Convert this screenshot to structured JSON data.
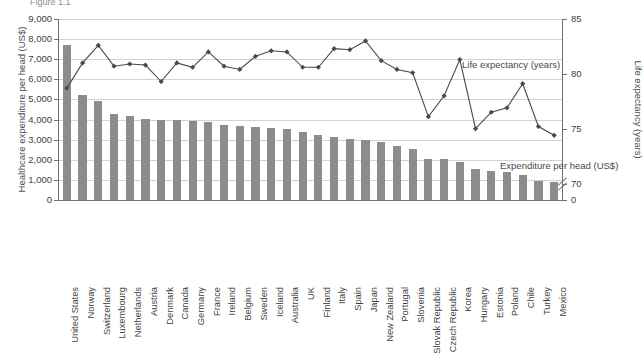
{
  "top_clipped_text": "Figure 1.1",
  "chart_data": {
    "type": "bar",
    "title": "",
    "xlabel": "",
    "ylabel": "Healthcare expenditure per head (US$)",
    "ylabel_right": "Life expectancy (years)",
    "ylim": [
      0,
      9000
    ],
    "ylim_right": [
      68.5,
      85
    ],
    "y_ticks": [
      "0",
      "1,000",
      "2,000",
      "3,000",
      "4,000",
      "5,000",
      "6,000",
      "7,000",
      "8,000",
      "9,000"
    ],
    "y_ticks_right": [
      "0",
      "70",
      "75",
      "80",
      "85"
    ],
    "right_axis_has_break": true,
    "grid": true,
    "legend_position": "inside-plot",
    "categories": [
      "United States",
      "Norway",
      "Switzerland",
      "Luxembourg",
      "Netherlands",
      "Austria",
      "Denmark",
      "Canada",
      "Germany",
      "France",
      "Ireland",
      "Belgium",
      "Sweden",
      "Iceland",
      "Australia",
      "UK",
      "Finland",
      "Italy",
      "Spain",
      "Japan",
      "New Zealand",
      "Portugal",
      "Slovenia",
      "Slovak Republic",
      "Czech Republic",
      "Korea",
      "Hungary",
      "Estonia",
      "Poland",
      "Chile",
      "Turkey",
      "Mexico"
    ],
    "series": [
      {
        "name": "Expenditure per head (US$)",
        "type": "bar",
        "color": "#8c8c8c",
        "axis": "left",
        "values": [
          7700,
          5200,
          4900,
          4300,
          4200,
          4050,
          4000,
          4000,
          3950,
          3900,
          3750,
          3700,
          3650,
          3600,
          3550,
          3400,
          3250,
          3150,
          3050,
          3000,
          2900,
          2700,
          2550,
          2050,
          2050,
          1900,
          1550,
          1450,
          1400,
          1250,
          950,
          900
        ]
      },
      {
        "name": "Life expectancy (years)",
        "type": "line",
        "color": "#4a4a4a",
        "marker": "diamond",
        "axis": "right",
        "values": [
          78.7,
          81.0,
          82.6,
          80.7,
          80.9,
          80.8,
          79.3,
          81.0,
          80.6,
          82.0,
          80.7,
          80.4,
          81.6,
          82.1,
          82.0,
          80.6,
          80.6,
          82.3,
          82.2,
          83.0,
          81.2,
          80.4,
          80.1,
          76.1,
          78.0,
          81.3,
          75.0,
          76.5,
          76.9,
          79.1,
          75.2,
          74.4
        ]
      }
    ],
    "annotations": [
      {
        "text": "Life expectancy (years)",
        "x_ref": "plot",
        "position": "upper-right"
      },
      {
        "text": "Expenditure per head (US$)",
        "x_ref": "plot",
        "position": "lower-right"
      }
    ]
  },
  "source_note": ""
}
